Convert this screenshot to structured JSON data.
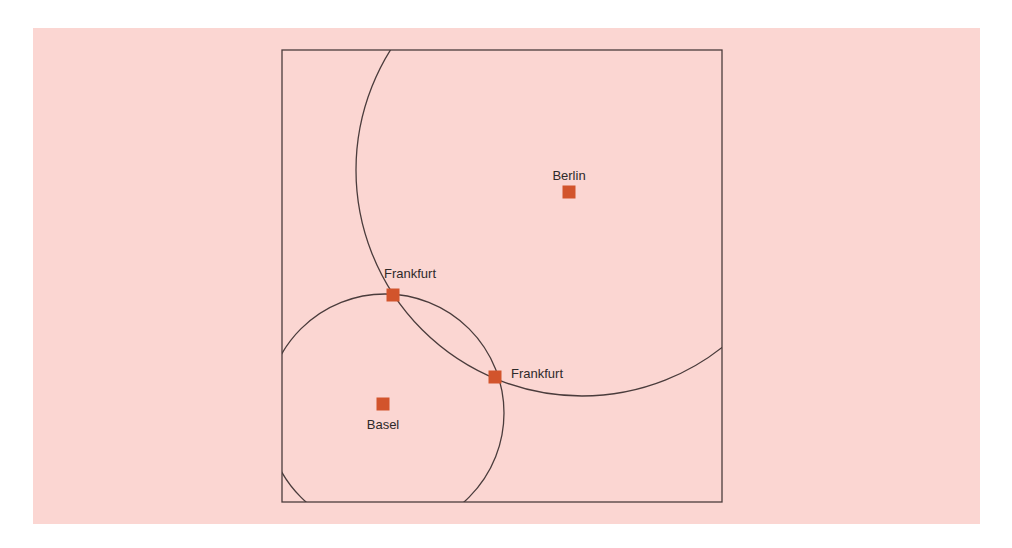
{
  "diagram": {
    "colors": {
      "background": "#fbd6d2",
      "line": "#4a3c3c",
      "marker": "#d2542c",
      "text": "#2e2a2a"
    },
    "frame": {
      "x": 282,
      "y": 50,
      "width": 440,
      "height": 452
    },
    "circles": [
      {
        "name": "large-circle",
        "cx": 582,
        "cy": 170,
        "r": 226
      },
      {
        "name": "small-circle",
        "cx": 385,
        "cy": 413,
        "r": 119
      }
    ],
    "cities": [
      {
        "label": "Berlin",
        "x": 569,
        "y": 192,
        "label_x": 569,
        "label_y": 180,
        "anchor": "middle"
      },
      {
        "label": "Frankfurt",
        "x": 393,
        "y": 295,
        "label_x": 384,
        "label_y": 278,
        "anchor": "start"
      },
      {
        "label": "Frankfurt",
        "x": 495,
        "y": 377,
        "label_x": 511,
        "label_y": 378,
        "anchor": "start"
      },
      {
        "label": "Basel",
        "x": 383,
        "y": 404,
        "label_x": 383,
        "label_y": 429,
        "anchor": "middle"
      }
    ]
  }
}
